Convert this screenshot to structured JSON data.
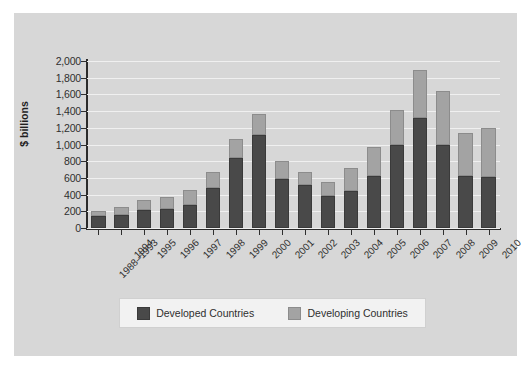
{
  "chart_data": {
    "type": "bar",
    "subtype": "stacked-vertical",
    "title": "",
    "subtitle": "",
    "xlabel": "",
    "ylabel": "$ billions",
    "ylim": [
      0,
      2000
    ],
    "ytick_step": 200,
    "ytick_labels": [
      "2,000",
      "1,800",
      "1,600",
      "1,400",
      "1,200",
      "1,000",
      "800",
      "600",
      "400",
      "200",
      "0"
    ],
    "ytick_values": [
      2000,
      1800,
      1600,
      1400,
      1200,
      1000,
      800,
      600,
      400,
      200,
      0
    ],
    "grid": true,
    "grid_axis": "y",
    "legend_position": "bottom",
    "categories": [
      "1988–1993",
      "1994",
      "1995",
      "1996",
      "1997",
      "1998",
      "1999",
      "2000",
      "2001",
      "2002",
      "2003",
      "2004",
      "2005",
      "2006",
      "2007",
      "2008",
      "2009",
      "2010"
    ],
    "series": [
      {
        "name": "Developed Countries",
        "color": "#494949",
        "values": [
          140,
          160,
          210,
          225,
          275,
          480,
          840,
          1110,
          590,
          510,
          380,
          440,
          620,
          1000,
          1320,
          995,
          620,
          610
        ]
      },
      {
        "name": "Developing Countries",
        "color": "#a3a3a3",
        "values": [
          60,
          95,
          120,
          145,
          185,
          190,
          230,
          255,
          210,
          160,
          175,
          280,
          355,
          415,
          570,
          650,
          520,
          590
        ]
      }
    ],
    "totals": [
      200,
      255,
      330,
      370,
      460,
      670,
      1070,
      1365,
      800,
      670,
      555,
      720,
      975,
      1415,
      1890,
      1645,
      1140,
      1200
    ]
  },
  "legend": {
    "entries": [
      {
        "label": "Developed Countries",
        "color": "#494949"
      },
      {
        "label": "Developing Countries",
        "color": "#a3a3a3"
      }
    ]
  },
  "colors": {
    "figure_background": "#d7d7d7",
    "page_background": "#ffffff",
    "axis": "#2b2b2b",
    "gridline": "#f0f0f0",
    "text": "#2f2f2f",
    "developed": "#494949",
    "developing": "#a3a3a3",
    "legend_background": "#f2f2f2"
  }
}
